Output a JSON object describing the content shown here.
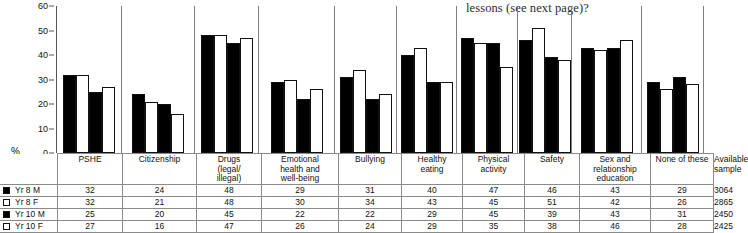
{
  "caption": "lessons (see next page)?",
  "chart_data": {
    "type": "bar",
    "title": "",
    "xlabel": "",
    "ylabel": "%",
    "ylim": [
      0,
      60
    ],
    "yticks": [
      0,
      10,
      20,
      30,
      40,
      50,
      60
    ],
    "grid": false,
    "legend_position": "table-row-labels",
    "categories": [
      "PSHE",
      "Citizenship",
      "Drugs (legal/ illegal)",
      "Emotional health and well-being",
      "Bullying",
      "Healthy eating",
      "Physical activity",
      "Safety",
      "Sex and relationship education",
      "None of these"
    ],
    "series": [
      {
        "name": "Yr 8 M",
        "fill": "filled",
        "values": [
          32,
          24,
          48,
          29,
          31,
          40,
          47,
          46,
          43,
          29
        ]
      },
      {
        "name": "Yr 8 F",
        "fill": "hollow",
        "values": [
          32,
          21,
          48,
          30,
          34,
          43,
          45,
          51,
          42,
          26
        ]
      },
      {
        "name": "Yr 10 M",
        "fill": "filled",
        "values": [
          25,
          20,
          45,
          22,
          22,
          29,
          45,
          39,
          43,
          31
        ]
      },
      {
        "name": "Yr 10 F",
        "fill": "hollow",
        "values": [
          27,
          16,
          47,
          26,
          24,
          29,
          35,
          38,
          46,
          28
        ]
      }
    ],
    "colors": {
      "filled": "#000000",
      "hollow": "#ffffff",
      "outline": "#111111"
    }
  },
  "table": {
    "corner_label": "",
    "columns": [
      {
        "key": "pshe",
        "lines": [
          "PSHE"
        ]
      },
      {
        "key": "citizenship",
        "lines": [
          "Citizenship"
        ]
      },
      {
        "key": "drugs",
        "lines": [
          "Drugs",
          "(legal/",
          "illegal)"
        ]
      },
      {
        "key": "emotional",
        "lines": [
          "Emotional",
          "health and",
          "well-being"
        ]
      },
      {
        "key": "bullying",
        "lines": [
          "Bullying"
        ]
      },
      {
        "key": "healthy",
        "lines": [
          "Healthy",
          "eating"
        ]
      },
      {
        "key": "physical",
        "lines": [
          "Physical",
          "activity"
        ]
      },
      {
        "key": "safety",
        "lines": [
          "Safety"
        ]
      },
      {
        "key": "sre",
        "lines": [
          "Sex and",
          "relationship",
          "education"
        ]
      },
      {
        "key": "none",
        "lines": [
          "None of these"
        ]
      },
      {
        "key": "sample",
        "lines": [
          "Available",
          "sample"
        ]
      }
    ],
    "rows": [
      {
        "label": "Yr 8 M",
        "swatch": "filled",
        "values": [
          "32",
          "24",
          "48",
          "29",
          "31",
          "40",
          "47",
          "46",
          "43",
          "29",
          "3064"
        ]
      },
      {
        "label": "Yr 8 F",
        "swatch": "hollow",
        "values": [
          "32",
          "21",
          "48",
          "30",
          "34",
          "43",
          "45",
          "51",
          "42",
          "26",
          "2865"
        ]
      },
      {
        "label": "Yr 10 M",
        "swatch": "filled",
        "values": [
          "25",
          "20",
          "45",
          "22",
          "22",
          "29",
          "45",
          "39",
          "43",
          "31",
          "2450"
        ]
      },
      {
        "label": "Yr 10 F",
        "swatch": "hollow",
        "values": [
          "27",
          "16",
          "47",
          "26",
          "24",
          "29",
          "35",
          "38",
          "46",
          "28",
          "2425"
        ]
      }
    ]
  }
}
